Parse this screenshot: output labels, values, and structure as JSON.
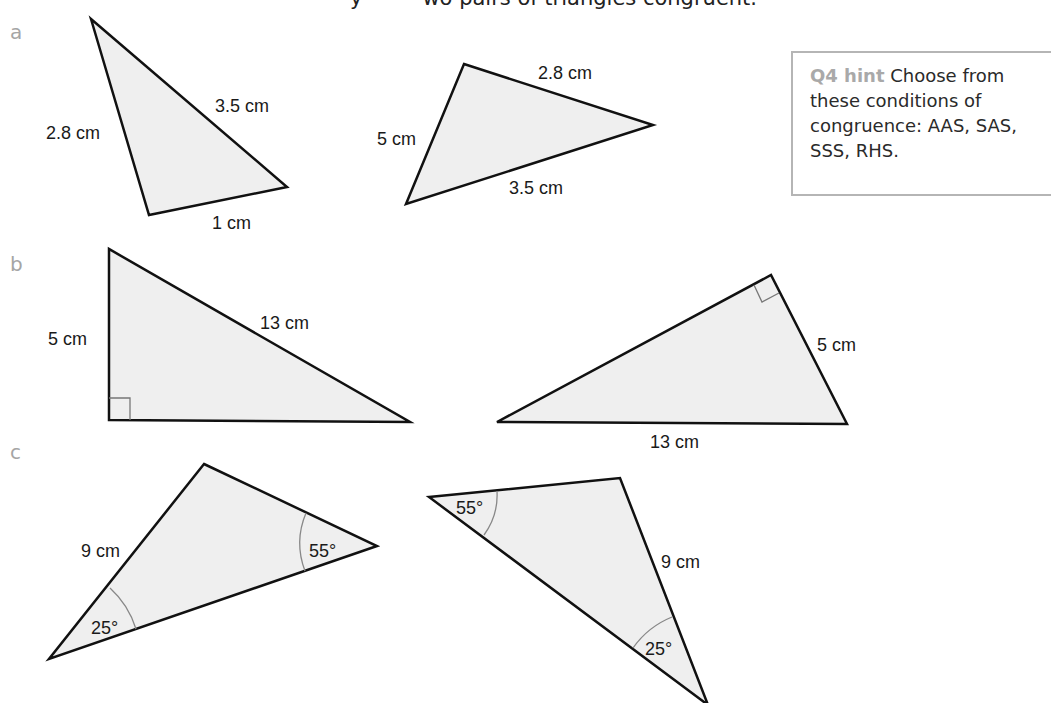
{
  "instruction": {
    "text_left": "y",
    "text_right": "wo pairs of triangles congruent."
  },
  "hint": {
    "label": "Q4 hint",
    "text": "Choose from these conditions of congruence: AAS, SAS, SSS, RHS."
  },
  "parts": [
    {
      "label": "a",
      "triangles": [
        {
          "sides": [
            "2.8 cm",
            "3.5 cm",
            "1 cm"
          ]
        },
        {
          "sides": [
            "1 cm",
            "2.8 cm",
            "3.5 cm"
          ]
        }
      ]
    },
    {
      "label": "b",
      "triangles": [
        {
          "sides": [
            "5 cm",
            "13 cm"
          ],
          "right_angle": true
        },
        {
          "sides": [
            "5 cm",
            "13 cm"
          ],
          "right_angle": true
        }
      ]
    },
    {
      "label": "c",
      "triangles": [
        {
          "sides": [
            "9 cm"
          ],
          "angles": [
            "55°",
            "25°"
          ]
        },
        {
          "sides": [
            "9 cm"
          ],
          "angles": [
            "55°",
            "25°"
          ]
        }
      ]
    }
  ],
  "colors": {
    "triangle_fill": "#efefef",
    "triangle_stroke": "#111111",
    "arc_stroke": "#888888",
    "label_grey": "#a5a5a5",
    "hint_border": "#b5b5b5"
  }
}
